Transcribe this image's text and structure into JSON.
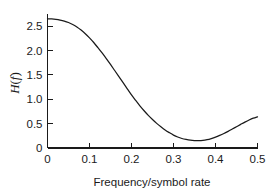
{
  "chart_data": {
    "type": "line",
    "title": "",
    "xlabel": "Frequency/symbol rate",
    "ylabel": "H(f)",
    "ylabel_parts": {
      "symbol": "H",
      "open": "(",
      "variable": "f",
      "close": ")"
    },
    "xlim": [
      0,
      0.5
    ],
    "ylim": [
      0,
      2.75
    ],
    "grid": false,
    "legend": null,
    "xticks": [
      0,
      0.1,
      0.2,
      0.3,
      0.4,
      0.5
    ],
    "xtick_labels": [
      "0",
      "0.1",
      "0.2",
      "0.3",
      "0.4",
      "0.5"
    ],
    "yticks": [
      0,
      0.5,
      1.0,
      1.5,
      2.0,
      2.5
    ],
    "ytick_labels": [
      "0",
      "0.5",
      "1.0",
      "1.5",
      "2.0",
      "2.5"
    ],
    "line_color": "#1a1a1a",
    "series": [
      {
        "name": "H(f)",
        "x": [
          0.0,
          0.01,
          0.02,
          0.03,
          0.04,
          0.05,
          0.06,
          0.07,
          0.08,
          0.09,
          0.1,
          0.11,
          0.12,
          0.13,
          0.14,
          0.15,
          0.16,
          0.17,
          0.18,
          0.19,
          0.2,
          0.21,
          0.22,
          0.23,
          0.24,
          0.25,
          0.26,
          0.27,
          0.28,
          0.29,
          0.3,
          0.31,
          0.32,
          0.33,
          0.34,
          0.35,
          0.36,
          0.37,
          0.38,
          0.39,
          0.4,
          0.41,
          0.42,
          0.43,
          0.44,
          0.45,
          0.46,
          0.47,
          0.48,
          0.49,
          0.5
        ],
        "y": [
          2.65,
          2.648,
          2.64,
          2.626,
          2.605,
          2.575,
          2.535,
          2.485,
          2.42,
          2.345,
          2.26,
          2.165,
          2.06,
          1.95,
          1.835,
          1.715,
          1.59,
          1.465,
          1.34,
          1.215,
          1.09,
          0.975,
          0.865,
          0.765,
          0.67,
          0.585,
          0.505,
          0.435,
          0.37,
          0.315,
          0.265,
          0.225,
          0.195,
          0.175,
          0.16,
          0.152,
          0.15,
          0.155,
          0.17,
          0.193,
          0.222,
          0.258,
          0.298,
          0.342,
          0.389,
          0.437,
          0.485,
          0.532,
          0.575,
          0.612,
          0.64
        ]
      }
    ],
    "annotations": {
      "start_value": 2.65,
      "minimum_x": 0.36,
      "minimum_y": 0.15,
      "end_value": 0.64
    }
  }
}
